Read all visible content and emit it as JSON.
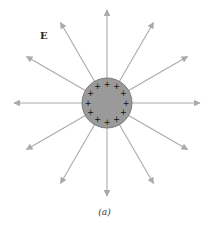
{
  "figure": {
    "field_label": "E",
    "caption": "(a)",
    "charge": {
      "sign": "+",
      "count": 12,
      "center": [
        107,
        103
      ],
      "radius": 25,
      "fill": "#9a9a9a",
      "stroke": "#666666"
    },
    "field_lines": {
      "count": 12,
      "angle_step_deg": 30,
      "start_radius": 25,
      "end_radius": 93,
      "color": "#aaaaaa",
      "direction": "outward"
    }
  }
}
